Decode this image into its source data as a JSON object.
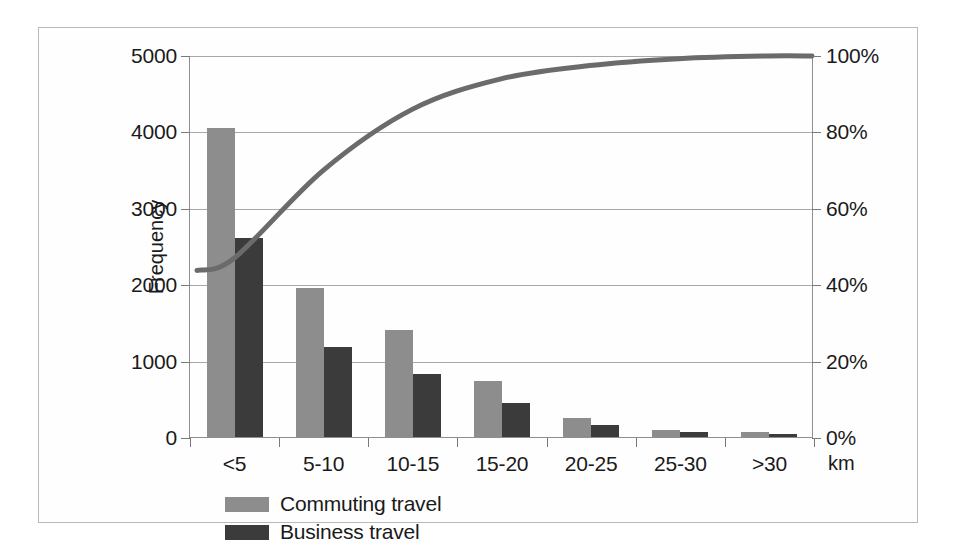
{
  "chart_data": {
    "type": "bar",
    "title": "",
    "subtitle": "",
    "xlabel": "km",
    "ylabel": "Frequency",
    "y2label": "Cumulative percentage",
    "categories": [
      "<5",
      "5-10",
      "10-15",
      "15-20",
      "20-25",
      "25-30",
      ">30"
    ],
    "ylim": [
      0,
      5000
    ],
    "yticks": [
      0,
      1000,
      2000,
      3000,
      4000,
      5000
    ],
    "ytick_labels": [
      "0",
      "1000",
      "2000",
      "3000",
      "4000",
      "5000"
    ],
    "y2lim": [
      0,
      100
    ],
    "y2ticks": [
      0,
      20,
      40,
      60,
      80,
      100
    ],
    "y2tick_labels": [
      "0%",
      "20%",
      "40%",
      "60%",
      "80%",
      "100%"
    ],
    "grid": true,
    "legend_position": "bottom-left",
    "series": [
      {
        "name": "Commuting travel",
        "kind": "bar",
        "color": "#8d8d8d",
        "values": [
          4050,
          1950,
          1400,
          730,
          250,
          90,
          70
        ]
      },
      {
        "name": "Business travel",
        "kind": "bar",
        "color": "#3b3b3b",
        "values": [
          2600,
          1180,
          820,
          440,
          160,
          60,
          40
        ]
      },
      {
        "name": "Cumulative percentage",
        "kind": "line",
        "axis": "y2",
        "color": "#6b6b6b",
        "values": [
          47,
          70,
          86,
          94,
          97.5,
          99.3,
          100
        ]
      }
    ]
  },
  "legend": {
    "items": [
      {
        "label": "Commuting travel",
        "color": "#8d8d8d"
      },
      {
        "label": "Business travel",
        "color": "#3b3b3b"
      }
    ]
  },
  "axes": {
    "y_title": "Frequency",
    "y2_title": "Cumulative percentage",
    "x_unit": "km"
  }
}
